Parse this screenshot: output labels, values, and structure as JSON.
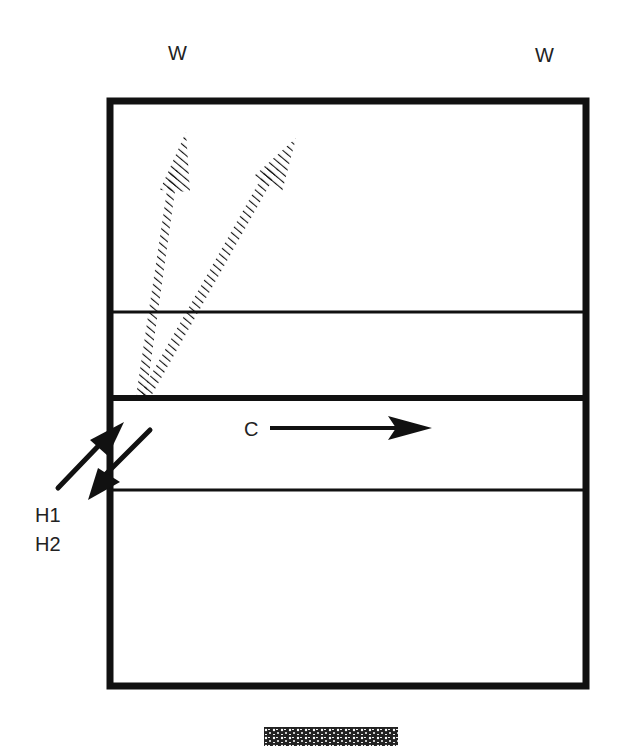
{
  "diagram": {
    "labels": {
      "w_left": "W",
      "w_right": "W",
      "c": "C",
      "h1": "H1",
      "h2": "H2"
    },
    "colors": {
      "ink": "#111111",
      "background": "#ffffff"
    },
    "elements": [
      {
        "id": "outer-box",
        "type": "rectangle",
        "thick": true
      },
      {
        "id": "upper-thin-line",
        "type": "horizontal-line"
      },
      {
        "id": "middle-thick-line",
        "type": "horizontal-line"
      },
      {
        "id": "lower-thin-line",
        "type": "horizontal-line"
      },
      {
        "id": "hatched-arrow-1",
        "type": "hatched-arrow",
        "direction": "up"
      },
      {
        "id": "hatched-arrow-2",
        "type": "hatched-arrow",
        "direction": "up-right"
      },
      {
        "id": "arrow-h1",
        "type": "arrow",
        "label": "H1",
        "direction": "up-right"
      },
      {
        "id": "arrow-h2",
        "type": "arrow",
        "label": "H2",
        "direction": "down-left"
      },
      {
        "id": "arrow-c",
        "type": "arrow",
        "label": "C",
        "direction": "right"
      },
      {
        "id": "texture-block",
        "type": "noise-pattern"
      }
    ]
  }
}
